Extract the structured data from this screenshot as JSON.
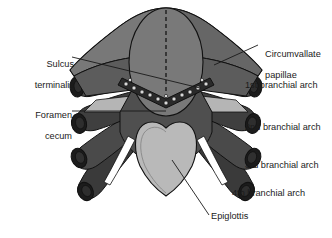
{
  "figure": {
    "background": "#ffffff",
    "palette": {
      "mid_gray": "#7a7a7a",
      "dark_gray": "#4a4a4a",
      "darker_gray": "#3a3a3a",
      "darkest": "#262626",
      "light_gray": "#b5b5b5",
      "pale_gray": "#c9c9c9",
      "outline": "#111111",
      "white": "#ffffff"
    }
  },
  "labels": {
    "sulcus_terminalis": {
      "line1": "Sulcus",
      "line2": "terminalis"
    },
    "foramen_cecum": {
      "line1": "Foramen",
      "line2": "cecum"
    },
    "circumvallate_papillae": {
      "line1": "Circumvallate",
      "line2": "papillae"
    },
    "arch1": "1st branchial arch",
    "arch2": "2nd branchial arch",
    "arch3": "3rd branchial arch",
    "arch4": "4th branchial arch",
    "epiglottis": "Epiglottis"
  },
  "structures": {
    "median_tongue_bud": "median tongue bud",
    "lateral_lingual_swellings": "lateral lingual swellings",
    "midline_raphe": "dashed midline",
    "papillae_count": 14
  }
}
